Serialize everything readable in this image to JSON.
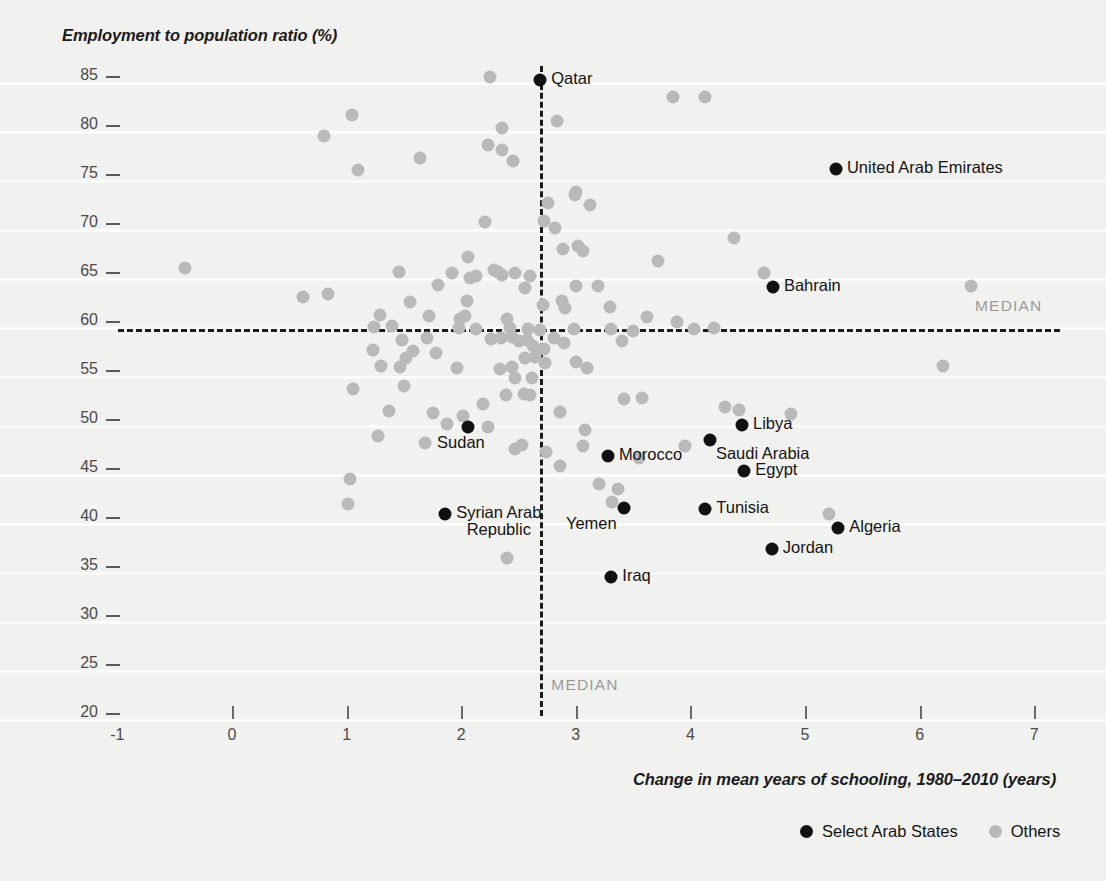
{
  "chart_data": {
    "type": "scatter",
    "title": "",
    "xlabel": "Change in mean years of schooling, 1980–2010 (years)",
    "ylabel": "Employment to population ratio (%)",
    "xlim": [
      -1,
      7
    ],
    "ylim": [
      20,
      85
    ],
    "xticks": [
      -1,
      0,
      1,
      2,
      3,
      4,
      5,
      6,
      7
    ],
    "yticks": [
      20,
      25,
      30,
      35,
      40,
      45,
      50,
      55,
      60,
      65,
      70,
      75,
      80,
      85
    ],
    "grid": "horizontal",
    "legend_position": "bottom-right",
    "median_x": 2.69,
    "median_y": 59.2,
    "median_label": "MEDIAN",
    "colors": {
      "select_arab_states": "#111111",
      "others": "#b9b9b9",
      "median_line": "#1a1a1a",
      "background": "#f1f1ef"
    },
    "legend": [
      {
        "label": "Select Arab States",
        "color": "#111111"
      },
      {
        "label": "Others",
        "color": "#b9b9b9"
      }
    ],
    "series": [
      {
        "name": "Select Arab States",
        "color": "#111111",
        "points": [
          {
            "label": "Qatar",
            "x": 2.69,
            "y": 84.6,
            "label_pos": "right"
          },
          {
            "label": "United Arab Emirates",
            "x": 5.27,
            "y": 75.5,
            "label_pos": "right"
          },
          {
            "label": "Bahrain",
            "x": 4.72,
            "y": 63.5,
            "label_pos": "right"
          },
          {
            "label": "Libya",
            "x": 4.45,
            "y": 49.4,
            "label_pos": "right"
          },
          {
            "label": "Saudi Arabia",
            "x": 4.17,
            "y": 47.9,
            "label_pos": "below-right"
          },
          {
            "label": "Sudan",
            "x": 2.06,
            "y": 49.2,
            "label_pos": "below"
          },
          {
            "label": "Morocco",
            "x": 3.28,
            "y": 46.2,
            "label_pos": "right"
          },
          {
            "label": "Egypt",
            "x": 4.47,
            "y": 44.7,
            "label_pos": "right"
          },
          {
            "label": "Tunisia",
            "x": 4.13,
            "y": 40.8,
            "label_pos": "right"
          },
          {
            "label": "Yemen",
            "x": 3.42,
            "y": 40.9,
            "label_pos": "below-left"
          },
          {
            "label": "Syrian Arab\nRepublic",
            "x": 1.86,
            "y": 40.3,
            "label_pos": "right-two-line"
          },
          {
            "label": "Algeria",
            "x": 5.29,
            "y": 38.9,
            "label_pos": "right"
          },
          {
            "label": "Jordan",
            "x": 4.71,
            "y": 36.7,
            "label_pos": "right"
          },
          {
            "label": "Iraq",
            "x": 3.31,
            "y": 33.9,
            "label_pos": "right"
          }
        ]
      },
      {
        "name": "Others",
        "color": "#b9b9b9",
        "points": [
          {
            "x": 2.25,
            "y": 84.9
          },
          {
            "x": 3.85,
            "y": 82.9
          },
          {
            "x": 4.13,
            "y": 82.9
          },
          {
            "x": 1.05,
            "y": 81.0
          },
          {
            "x": 2.84,
            "y": 80.4
          },
          {
            "x": 0.8,
            "y": 78.9
          },
          {
            "x": 2.36,
            "y": 79.7
          },
          {
            "x": 2.23,
            "y": 78.0
          },
          {
            "x": 2.36,
            "y": 77.4
          },
          {
            "x": 2.45,
            "y": 76.3
          },
          {
            "x": 1.64,
            "y": 76.6
          },
          {
            "x": 1.1,
            "y": 75.4
          },
          {
            "x": 3.0,
            "y": 73.2
          },
          {
            "x": 2.99,
            "y": 72.9
          },
          {
            "x": 3.12,
            "y": 71.8
          },
          {
            "x": 2.76,
            "y": 72.0
          },
          {
            "x": 2.21,
            "y": 70.1
          },
          {
            "x": 2.72,
            "y": 70.2
          },
          {
            "x": 4.38,
            "y": 68.5
          },
          {
            "x": 2.82,
            "y": 69.5
          },
          {
            "x": 3.02,
            "y": 67.7
          },
          {
            "x": 2.89,
            "y": 67.3
          },
          {
            "x": 3.06,
            "y": 67.1
          },
          {
            "x": 2.06,
            "y": 66.5
          },
          {
            "x": 3.72,
            "y": 66.1
          },
          {
            "x": -0.41,
            "y": 65.4
          },
          {
            "x": 1.46,
            "y": 65.0
          },
          {
            "x": 1.92,
            "y": 64.9
          },
          {
            "x": 2.08,
            "y": 64.4
          },
          {
            "x": 2.13,
            "y": 64.6
          },
          {
            "x": 2.32,
            "y": 65.0
          },
          {
            "x": 2.36,
            "y": 64.7
          },
          {
            "x": 2.29,
            "y": 65.2
          },
          {
            "x": 2.47,
            "y": 64.9
          },
          {
            "x": 2.6,
            "y": 64.6
          },
          {
            "x": 4.64,
            "y": 64.9
          },
          {
            "x": 6.45,
            "y": 63.6
          },
          {
            "x": 1.8,
            "y": 63.7
          },
          {
            "x": 2.56,
            "y": 63.4
          },
          {
            "x": 3.0,
            "y": 63.6
          },
          {
            "x": 3.19,
            "y": 63.6
          },
          {
            "x": 0.62,
            "y": 62.5
          },
          {
            "x": 0.84,
            "y": 62.8
          },
          {
            "x": 2.88,
            "y": 62.0
          },
          {
            "x": 1.55,
            "y": 61.9
          },
          {
            "x": 2.05,
            "y": 62.0
          },
          {
            "x": 2.71,
            "y": 61.6
          },
          {
            "x": 2.91,
            "y": 61.3
          },
          {
            "x": 3.3,
            "y": 61.4
          },
          {
            "x": 1.29,
            "y": 60.6
          },
          {
            "x": 1.72,
            "y": 60.5
          },
          {
            "x": 2.03,
            "y": 60.5
          },
          {
            "x": 1.99,
            "y": 60.2
          },
          {
            "x": 2.4,
            "y": 60.2
          },
          {
            "x": 3.62,
            "y": 60.4
          },
          {
            "x": 3.88,
            "y": 59.9
          },
          {
            "x": 1.24,
            "y": 59.4
          },
          {
            "x": 1.4,
            "y": 59.5
          },
          {
            "x": 1.98,
            "y": 59.3
          },
          {
            "x": 2.13,
            "y": 59.2
          },
          {
            "x": 2.43,
            "y": 59.3
          },
          {
            "x": 2.58,
            "y": 59.2
          },
          {
            "x": 2.69,
            "y": 59.1
          },
          {
            "x": 2.98,
            "y": 59.2
          },
          {
            "x": 3.31,
            "y": 59.2
          },
          {
            "x": 3.5,
            "y": 59.0
          },
          {
            "x": 4.03,
            "y": 59.2
          },
          {
            "x": 4.21,
            "y": 59.3
          },
          {
            "x": 1.48,
            "y": 58.1
          },
          {
            "x": 1.7,
            "y": 58.3
          },
          {
            "x": 2.26,
            "y": 58.2
          },
          {
            "x": 2.35,
            "y": 58.3
          },
          {
            "x": 2.44,
            "y": 58.4
          },
          {
            "x": 2.5,
            "y": 58.0
          },
          {
            "x": 2.57,
            "y": 58.1
          },
          {
            "x": 2.81,
            "y": 58.3
          },
          {
            "x": 2.9,
            "y": 57.8
          },
          {
            "x": 3.4,
            "y": 58.0
          },
          {
            "x": 2.63,
            "y": 57.4
          },
          {
            "x": 2.72,
            "y": 57.1
          },
          {
            "x": 1.23,
            "y": 57.0
          },
          {
            "x": 1.58,
            "y": 56.9
          },
          {
            "x": 1.78,
            "y": 56.7
          },
          {
            "x": 2.56,
            "y": 56.2
          },
          {
            "x": 2.64,
            "y": 56.3
          },
          {
            "x": 2.73,
            "y": 55.7
          },
          {
            "x": 3.0,
            "y": 55.8
          },
          {
            "x": 1.3,
            "y": 55.4
          },
          {
            "x": 1.47,
            "y": 55.3
          },
          {
            "x": 1.96,
            "y": 55.2
          },
          {
            "x": 2.34,
            "y": 55.1
          },
          {
            "x": 2.44,
            "y": 55.3
          },
          {
            "x": 3.1,
            "y": 55.2
          },
          {
            "x": 6.2,
            "y": 55.4
          },
          {
            "x": 2.47,
            "y": 54.2
          },
          {
            "x": 2.62,
            "y": 54.2
          },
          {
            "x": 1.06,
            "y": 53.1
          },
          {
            "x": 1.5,
            "y": 53.4
          },
          {
            "x": 2.55,
            "y": 52.6
          },
          {
            "x": 2.6,
            "y": 52.4
          },
          {
            "x": 2.39,
            "y": 52.5
          },
          {
            "x": 3.42,
            "y": 52.0
          },
          {
            "x": 3.58,
            "y": 52.1
          },
          {
            "x": 4.3,
            "y": 51.2
          },
          {
            "x": 1.37,
            "y": 50.8
          },
          {
            "x": 1.75,
            "y": 50.6
          },
          {
            "x": 2.02,
            "y": 50.3
          },
          {
            "x": 2.86,
            "y": 50.7
          },
          {
            "x": 4.88,
            "y": 50.5
          },
          {
            "x": 4.42,
            "y": 50.9
          },
          {
            "x": 1.27,
            "y": 48.3
          },
          {
            "x": 1.88,
            "y": 49.5
          },
          {
            "x": 2.23,
            "y": 49.2
          },
          {
            "x": 3.08,
            "y": 48.9
          },
          {
            "x": 1.68,
            "y": 47.6
          },
          {
            "x": 2.47,
            "y": 46.9
          },
          {
            "x": 2.53,
            "y": 47.3
          },
          {
            "x": 2.74,
            "y": 46.6
          },
          {
            "x": 3.06,
            "y": 47.2
          },
          {
            "x": 3.95,
            "y": 47.2
          },
          {
            "x": 3.55,
            "y": 46.0
          },
          {
            "x": 2.86,
            "y": 45.2
          },
          {
            "x": 1.03,
            "y": 43.9
          },
          {
            "x": 3.2,
            "y": 43.4
          },
          {
            "x": 3.37,
            "y": 42.9
          },
          {
            "x": 5.21,
            "y": 40.3
          },
          {
            "x": 3.32,
            "y": 41.5
          },
          {
            "x": 1.01,
            "y": 41.3
          },
          {
            "x": 2.4,
            "y": 35.8
          },
          {
            "x": 1.52,
            "y": 56.2
          },
          {
            "x": 2.19,
            "y": 51.5
          }
        ]
      }
    ]
  },
  "axis": {
    "y_title": "Employment to population ratio (%)",
    "x_title": "Change in mean years of schooling, 1980–2010 (years)",
    "y_ticks": [
      "85",
      "80",
      "75",
      "70",
      "65",
      "60",
      "55",
      "50",
      "45",
      "40",
      "35",
      "30",
      "25",
      "20"
    ],
    "x_ticks": [
      "-1",
      "0",
      "1",
      "2",
      "3",
      "4",
      "5",
      "6",
      "7"
    ]
  },
  "median": {
    "horizontal_label": "MEDIAN",
    "vertical_label": "MEDIAN"
  },
  "legend": {
    "items": [
      {
        "label": "Select Arab States",
        "swatch": "black"
      },
      {
        "label": "Others",
        "swatch": "gray"
      }
    ]
  }
}
